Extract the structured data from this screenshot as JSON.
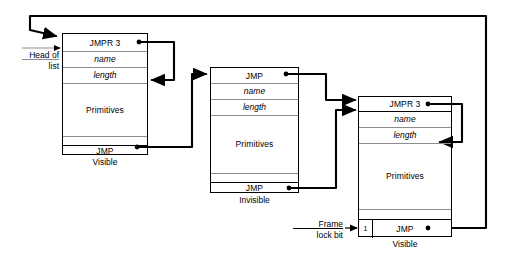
{
  "diagram": {
    "colors": {
      "outline": "#000000",
      "inner_separator": "#8d8d8d",
      "wire": "#000000",
      "background": "#ffffff"
    },
    "labels": {
      "head_of_list_line1": "Head of",
      "head_of_list_line2": "list",
      "frame_lock_line1": "Frame",
      "frame_lock_line2": "lock bit"
    },
    "frames": [
      {
        "id": "frame-1",
        "caption": "Visible",
        "rows": [
          {
            "text": "JMPR 3",
            "style": "plain",
            "name": "jmpr-cell"
          },
          {
            "text": "name",
            "style": "italic",
            "name": "name-cell"
          },
          {
            "text": "length",
            "style": "italic",
            "name": "length-cell"
          },
          {
            "text": "Primitives",
            "style": "plain",
            "name": "primitives-cell"
          },
          {
            "text": "",
            "style": "plain",
            "name": "spacer-cell"
          },
          {
            "text": "JMP",
            "style": "plain",
            "name": "jmp-cell"
          }
        ]
      },
      {
        "id": "frame-2",
        "caption": "Invisible",
        "rows": [
          {
            "text": "JMP",
            "style": "plain",
            "name": "jmp-top-cell"
          },
          {
            "text": "name",
            "style": "italic",
            "name": "name-cell"
          },
          {
            "text": "length",
            "style": "italic",
            "name": "length-cell"
          },
          {
            "text": "Primitives",
            "style": "plain",
            "name": "primitives-cell"
          },
          {
            "text": "",
            "style": "plain",
            "name": "spacer-cell"
          },
          {
            "text": "JMP",
            "style": "plain",
            "name": "jmp-cell"
          }
        ]
      },
      {
        "id": "frame-3",
        "caption": "Visible",
        "lock_bit_value": "1",
        "rows": [
          {
            "text": "JMPR 3",
            "style": "plain",
            "name": "jmpr-cell"
          },
          {
            "text": "name",
            "style": "italic",
            "name": "name-cell"
          },
          {
            "text": "length",
            "style": "italic",
            "name": "length-cell"
          },
          {
            "text": "Primitives",
            "style": "plain",
            "name": "primitives-cell"
          },
          {
            "text": "",
            "style": "plain",
            "name": "spacer-cell"
          },
          {
            "text": "JMP",
            "style": "plain",
            "name": "jmp-cell"
          }
        ]
      }
    ]
  }
}
